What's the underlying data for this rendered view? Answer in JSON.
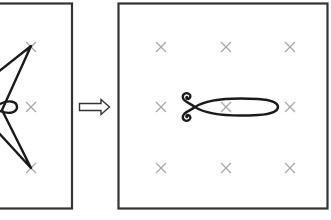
{
  "diagram": {
    "colors": {
      "frame": "#333333",
      "cross": "#a8a8a8",
      "curve": "#1a1a1a",
      "background": "#ffffff"
    },
    "left_panel": {
      "label": "before",
      "crosses": [
        {
          "x": 31,
          "y": 47
        },
        {
          "x": 31,
          "y": 107
        },
        {
          "x": 31,
          "y": 168
        }
      ],
      "shape": "star-with-small-loop"
    },
    "arrow": {
      "label": "transforms-to",
      "direction": "right"
    },
    "right_panel": {
      "label": "after",
      "crosses": [
        {
          "x": 161,
          "y": 47
        },
        {
          "x": 226,
          "y": 47
        },
        {
          "x": 290,
          "y": 47
        },
        {
          "x": 161,
          "y": 107
        },
        {
          "x": 226,
          "y": 107
        },
        {
          "x": 290,
          "y": 107
        },
        {
          "x": 161,
          "y": 168
        },
        {
          "x": 226,
          "y": 168
        },
        {
          "x": 290,
          "y": 168
        }
      ],
      "shape": "elongated-ellipse-with-curls"
    }
  }
}
